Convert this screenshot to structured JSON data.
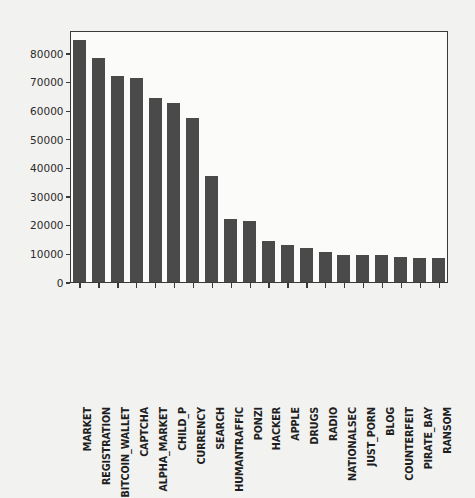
{
  "chart_data": {
    "type": "bar",
    "title": "",
    "xlabel": "",
    "ylabel": "",
    "ylim": [
      0,
      88000
    ],
    "grid": false,
    "legend": null,
    "bar_color": "#4a4a4a",
    "background_color": "#f2f2f0",
    "axes_color": "#3a3a3a",
    "ytick_labels": [
      "0",
      "10000",
      "20000",
      "30000",
      "40000",
      "50000",
      "60000",
      "70000",
      "80000"
    ],
    "ytick_values": [
      0,
      10000,
      20000,
      30000,
      40000,
      50000,
      60000,
      70000,
      80000
    ],
    "categories": [
      "MARKET",
      "REGISTRATION",
      "BITCOIN_WALLET",
      "CAPTCHA",
      "ALPHA_MARKET",
      "CHILD_P",
      "CURRENCY",
      "SEARCH",
      "HUMANTRAFFIC",
      "PONZI",
      "HACKER",
      "APPLE",
      "DRUGS",
      "RADIO",
      "NATIONALSEC",
      "JUST_PORN",
      "BLOG",
      "COUNTERFEIT",
      "PIRATE_BAY",
      "RANSOM"
    ],
    "values": [
      84500,
      78300,
      72000,
      71300,
      64200,
      62400,
      57400,
      37000,
      22000,
      21200,
      14300,
      12800,
      11900,
      10400,
      9600,
      9300,
      9300,
      8700,
      8400,
      8300
    ]
  }
}
